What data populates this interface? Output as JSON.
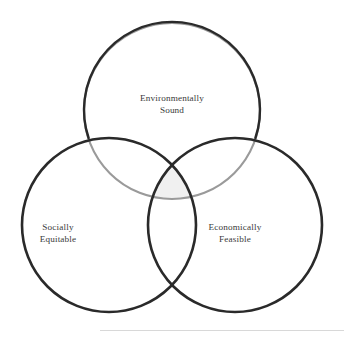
{
  "diagram": {
    "type": "venn-three-circle",
    "background_color": "#ffffff",
    "stroke_color_dark": "#2a2a2a",
    "stroke_color_gray": "#9a9a9a",
    "intersection_fill": "#f0f0f0",
    "text_color": "#3a3a3a",
    "circles": [
      {
        "id": "environmentally-sound",
        "label_line_1": "Environmentally",
        "label_line_2": "Sound",
        "cx": 172,
        "cy": 111,
        "r": 88,
        "stroke": "#2a2a2a"
      },
      {
        "id": "socially-equitable",
        "label_line_1": "Socially",
        "label_line_2": "Equitable",
        "cx": 109,
        "cy": 225,
        "r": 87,
        "stroke": "#2a2a2a"
      },
      {
        "id": "economically-feasible",
        "label_line_1": "Economically",
        "label_line_2": "Feasible",
        "cx": 235,
        "cy": 225,
        "r": 87,
        "stroke": "#2a2a2a"
      }
    ]
  }
}
